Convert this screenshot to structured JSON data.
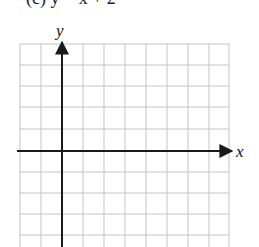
{
  "figure": {
    "caption_partial": "(c)   y = x + 2",
    "x_axis_label": "x",
    "y_axis_label": "y",
    "grid": {
      "columns": 10,
      "rows_visible": 10,
      "cell_size_px": 21,
      "line_color": "#c4c4c4",
      "axis_color": "#1a1a1a"
    },
    "origin_grid_position": {
      "column_line": 2,
      "row_line": 5
    }
  }
}
